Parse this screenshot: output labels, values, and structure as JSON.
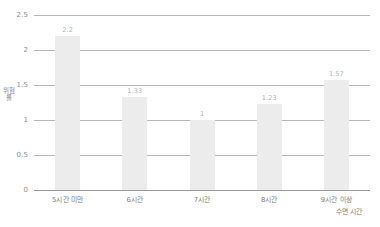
{
  "chart_data": {
    "type": "bar",
    "title": "",
    "categories": [
      "5시간 미만",
      "6시간",
      "7시간",
      "8시간",
      "9시간 이상"
    ],
    "values": [
      2.2,
      1.33,
      1,
      1.23,
      1.57
    ],
    "value_labels": [
      "2.2",
      "1.33",
      "1",
      "1.23",
      "1.57"
    ],
    "xlabel": "수면 시간",
    "ylabel": "위험률",
    "ylim": [
      0,
      2.5
    ],
    "yticks": [
      0,
      0.5,
      1,
      1.5,
      2,
      2.5
    ],
    "ytick_labels": [
      "0",
      "0.5",
      "1",
      "1.5",
      "2",
      "2.5"
    ],
    "grid": true,
    "legend": false,
    "bar_color": "#ececec",
    "grid_color": "#b8b8b8",
    "text_color": "#7d7d7d"
  }
}
